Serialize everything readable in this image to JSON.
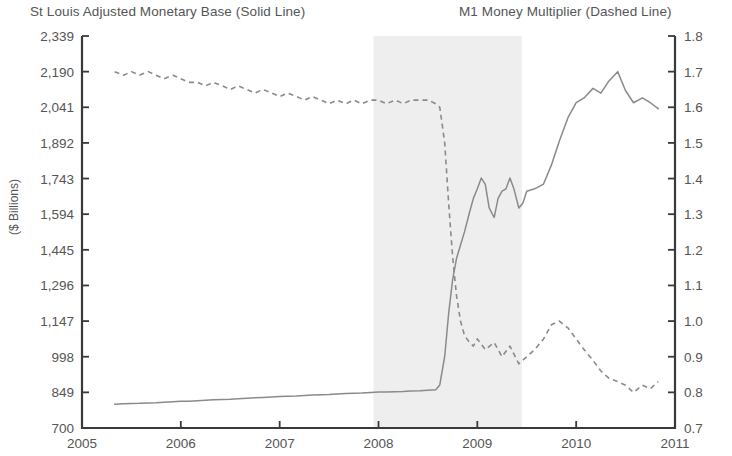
{
  "titles": {
    "left": "St Louis Adjusted Monetary Base (Solid Line)",
    "right": "M1 Money Multiplier (Dashed Line)"
  },
  "axis_titles": {
    "left": "($ Billions)"
  },
  "chart_data": {
    "type": "line",
    "subtitle": "",
    "xlabel": "",
    "ylabel": "($ Billions)",
    "y2label": "",
    "grid": false,
    "legend_position": "top",
    "xlim": [
      2005,
      2011
    ],
    "ylim": [
      700,
      2339
    ],
    "y2lim": [
      0.7,
      1.8
    ],
    "x_ticks": [
      "2005",
      "2006",
      "2007",
      "2008",
      "2009",
      "2010",
      "2011"
    ],
    "x_tick_values": [
      2005,
      2006,
      2007,
      2008,
      2009,
      2010,
      2011
    ],
    "y_ticks": [
      "700",
      "849",
      "998",
      "1,147",
      "1,296",
      "1,445",
      "1,594",
      "1,743",
      "1,892",
      "2,041",
      "2,190",
      "2,339"
    ],
    "y_tick_values": [
      700,
      849,
      998,
      1147,
      1296,
      1445,
      1594,
      1743,
      1892,
      2041,
      2190,
      2339
    ],
    "y2_ticks": [
      "0.7",
      "0.8",
      "0.9",
      "1.0",
      "1.1",
      "1.2",
      "1.3",
      "1.4",
      "1.5",
      "1.6",
      "1.7",
      "1.8"
    ],
    "y2_tick_values": [
      0.7,
      0.8,
      0.9,
      1.0,
      1.1,
      1.2,
      1.3,
      1.4,
      1.5,
      1.6,
      1.7,
      1.8
    ],
    "annotations": [
      {
        "type": "band",
        "name": "recession-shading",
        "x_start": 2007.95,
        "x_end": 2009.45,
        "color": "#eeeeee",
        "label": ""
      }
    ],
    "series": [
      {
        "name": "St Louis Adjusted Monetary Base (Solid Line)",
        "style": "solid",
        "axis": "left",
        "color": "#8a8a8a",
        "units": "$ Billions",
        "x": [
          2005.33,
          2005.42,
          2005.5,
          2005.58,
          2005.67,
          2005.75,
          2005.83,
          2005.92,
          2006.0,
          2006.08,
          2006.17,
          2006.25,
          2006.33,
          2006.42,
          2006.5,
          2006.58,
          2006.67,
          2006.75,
          2006.83,
          2006.92,
          2007.0,
          2007.08,
          2007.17,
          2007.25,
          2007.33,
          2007.42,
          2007.5,
          2007.58,
          2007.67,
          2007.75,
          2007.83,
          2007.92,
          2008.0,
          2008.08,
          2008.17,
          2008.25,
          2008.33,
          2008.42,
          2008.5,
          2008.58,
          2008.62,
          2008.67,
          2008.71,
          2008.75,
          2008.79,
          2008.83,
          2008.87,
          2008.92,
          2008.96,
          2009.0,
          2009.04,
          2009.08,
          2009.12,
          2009.17,
          2009.21,
          2009.25,
          2009.29,
          2009.33,
          2009.37,
          2009.42,
          2009.46,
          2009.5,
          2009.58,
          2009.67,
          2009.75,
          2009.83,
          2009.92,
          2010.0,
          2010.08,
          2010.17,
          2010.25,
          2010.33,
          2010.42,
          2010.5,
          2010.58,
          2010.67,
          2010.75,
          2010.83
        ],
        "y": [
          799,
          801,
          802,
          803,
          805,
          806,
          808,
          810,
          812,
          812,
          814,
          816,
          818,
          819,
          820,
          822,
          824,
          826,
          828,
          830,
          832,
          833,
          834,
          836,
          838,
          839,
          840,
          842,
          844,
          845,
          846,
          848,
          850,
          851,
          852,
          853,
          855,
          856,
          858,
          860,
          880,
          1000,
          1180,
          1320,
          1410,
          1465,
          1520,
          1600,
          1660,
          1700,
          1745,
          1720,
          1620,
          1580,
          1660,
          1690,
          1700,
          1745,
          1700,
          1620,
          1640,
          1690,
          1700,
          1720,
          1800,
          1900,
          2000,
          2060,
          2080,
          2120,
          2100,
          2150,
          2190,
          2110,
          2060,
          2080,
          2060,
          2035
        ]
      },
      {
        "name": "M1 Money Multiplier (Dashed Line)",
        "style": "dashed",
        "axis": "right",
        "color": "#8a8a8a",
        "units": "ratio",
        "x": [
          2005.33,
          2005.42,
          2005.5,
          2005.58,
          2005.67,
          2005.75,
          2005.83,
          2005.92,
          2006.0,
          2006.08,
          2006.17,
          2006.25,
          2006.33,
          2006.42,
          2006.5,
          2006.58,
          2006.67,
          2006.75,
          2006.83,
          2006.92,
          2007.0,
          2007.08,
          2007.17,
          2007.25,
          2007.33,
          2007.42,
          2007.5,
          2007.58,
          2007.67,
          2007.75,
          2007.83,
          2007.92,
          2008.0,
          2008.08,
          2008.17,
          2008.25,
          2008.33,
          2008.42,
          2008.5,
          2008.58,
          2008.62,
          2008.67,
          2008.71,
          2008.75,
          2008.79,
          2008.83,
          2008.87,
          2008.92,
          2008.96,
          2009.0,
          2009.08,
          2009.17,
          2009.25,
          2009.33,
          2009.42,
          2009.5,
          2009.58,
          2009.67,
          2009.75,
          2009.83,
          2009.92,
          2010.0,
          2010.08,
          2010.17,
          2010.25,
          2010.33,
          2010.42,
          2010.5,
          2010.58,
          2010.67,
          2010.75,
          2010.83
        ],
        "y": [
          1.7,
          1.69,
          1.7,
          1.69,
          1.7,
          1.69,
          1.68,
          1.69,
          1.68,
          1.67,
          1.67,
          1.66,
          1.67,
          1.66,
          1.65,
          1.66,
          1.65,
          1.64,
          1.65,
          1.64,
          1.63,
          1.64,
          1.63,
          1.62,
          1.63,
          1.62,
          1.61,
          1.62,
          1.61,
          1.62,
          1.61,
          1.62,
          1.62,
          1.61,
          1.62,
          1.61,
          1.62,
          1.62,
          1.62,
          1.61,
          1.6,
          1.5,
          1.33,
          1.18,
          1.07,
          1.0,
          0.96,
          0.94,
          0.93,
          0.95,
          0.92,
          0.94,
          0.9,
          0.93,
          0.88,
          0.9,
          0.92,
          0.95,
          0.99,
          1.0,
          0.98,
          0.95,
          0.92,
          0.89,
          0.86,
          0.84,
          0.83,
          0.82,
          0.8,
          0.82,
          0.81,
          0.83
        ]
      }
    ]
  }
}
